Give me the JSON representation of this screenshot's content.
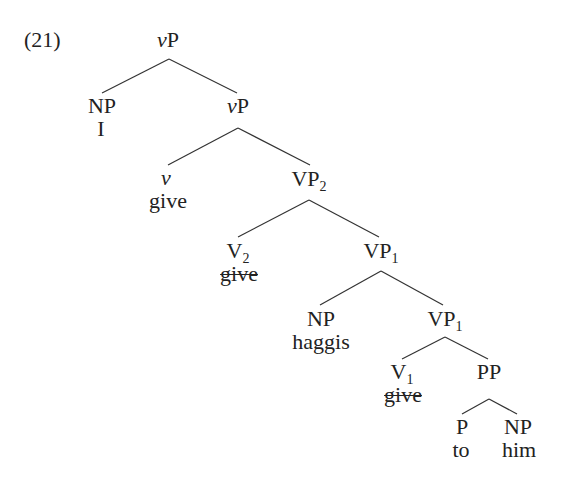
{
  "example_number": "(21)",
  "tree": {
    "root": {
      "label": "vP",
      "label_italic_part": "v",
      "label_rest": "P"
    },
    "nodes": {
      "np_subject": {
        "label": "NP",
        "word": "I"
      },
      "vP_bar": {
        "label_italic_part": "v",
        "label_rest": "P"
      },
      "v_head": {
        "label": "v",
        "word": "give"
      },
      "VP2": {
        "label": "VP",
        "subscript": "2"
      },
      "V2": {
        "label": "V",
        "subscript": "2",
        "word": "give",
        "word_struck": true
      },
      "VP1_upper": {
        "label": "VP",
        "subscript": "1"
      },
      "np_object": {
        "label": "NP",
        "word": "haggis"
      },
      "VP1_lower": {
        "label": "VP",
        "subscript": "1"
      },
      "V1": {
        "label": "V",
        "subscript": "1",
        "word": "give",
        "word_struck": true
      },
      "PP": {
        "label": "PP"
      },
      "P": {
        "label": "P",
        "word": "to"
      },
      "np_pp": {
        "label": "NP",
        "word": "him"
      }
    }
  },
  "colors": {
    "text": "#222222",
    "lines": "#333333",
    "background": "#ffffff"
  }
}
